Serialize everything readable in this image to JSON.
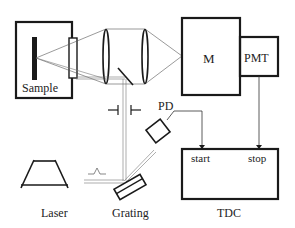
{
  "diagram": {
    "type": "optical-setup-schematic",
    "labels": {
      "sample": "Sample",
      "monochromator": "M",
      "pmt": "PMT",
      "photodiode": "PD",
      "tdc_start": "start",
      "tdc_stop": "stop",
      "laser": "Laser",
      "grating": "Grating",
      "tdc": "TDC"
    },
    "components": [
      {
        "id": "sample-chamber",
        "label": "Sample"
      },
      {
        "id": "window",
        "label": ""
      },
      {
        "id": "lens-1",
        "label": ""
      },
      {
        "id": "lens-2",
        "label": ""
      },
      {
        "id": "mirror",
        "label": ""
      },
      {
        "id": "monochromator",
        "label": "M"
      },
      {
        "id": "pmt",
        "label": "PMT"
      },
      {
        "id": "aperture",
        "label": ""
      },
      {
        "id": "photodiode",
        "label": "PD"
      },
      {
        "id": "laser",
        "label": "Laser"
      },
      {
        "id": "grating",
        "label": "Grating"
      },
      {
        "id": "tdc",
        "label": "TDC"
      }
    ],
    "connections": [
      {
        "from": "PD",
        "to": "TDC start"
      },
      {
        "from": "PMT",
        "to": "TDC stop"
      }
    ]
  }
}
